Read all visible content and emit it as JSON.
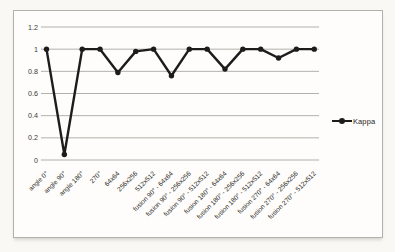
{
  "chart_data": {
    "type": "line",
    "title": "",
    "categories": [
      "angle 0°",
      "angle 90°",
      "angle 180°",
      "270°",
      "64x64",
      "256x256",
      "512x512",
      "fusion 90° - 64x64",
      "fusion 90° - 256x256",
      "fusion 90° - 512x512",
      "fusion 180° - 64x64",
      "fusion 180° - 256x256",
      "fusion 180° - 512x512",
      "fusion 270° - 64x64",
      "fusion 270° - 256x256",
      "fusion 270° - 512x512"
    ],
    "series": [
      {
        "name": "Kappa",
        "values": [
          1,
          0.05,
          1,
          1,
          0.79,
          0.98,
          1,
          0.76,
          1,
          1,
          0.82,
          1,
          1,
          0.92,
          1,
          1
        ],
        "marker": "circle"
      }
    ],
    "ylim": [
      0,
      1.2
    ],
    "ytick_values": [
      0,
      0.2,
      0.4,
      0.6,
      0.8,
      1,
      1.2
    ],
    "ytick_labels": [
      "0",
      "0.2",
      "0.4",
      "0.6",
      "0.8",
      "1",
      "1.2"
    ],
    "grid": true,
    "legend_position": "right",
    "colors": {
      "line": "#1c1c1c",
      "gridline": "#b2b0ab",
      "tick_text": "#3a3936",
      "category_text": "#2e2d2a"
    }
  }
}
